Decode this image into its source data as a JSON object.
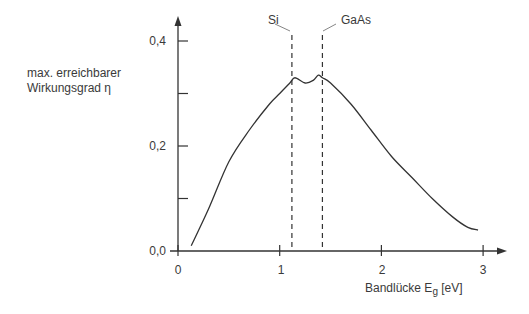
{
  "chart_data": {
    "type": "line",
    "title": "",
    "xlabel": "Bandlücke E_g [eV]",
    "xlabel_main": "Bandlücke E",
    "xlabel_sub": "g",
    "xlabel_unit": " [eV]",
    "ylabel_lines": [
      "max. erreichbarer",
      "Wirkungsgrad η"
    ],
    "ylabel": "max. erreichbarer Wirkungsgrad η",
    "xlim": [
      0,
      3.2
    ],
    "ylim": [
      0,
      0.45
    ],
    "x_ticks": [
      0,
      1,
      2,
      3
    ],
    "x_tick_labels": [
      "0",
      "1",
      "2",
      "3"
    ],
    "y_ticks": [
      0.0,
      0.1,
      0.2,
      0.3,
      0.4
    ],
    "y_tick_labels": [
      "0,0",
      "",
      "0,2",
      "",
      "0,4"
    ],
    "grid": false,
    "series": [
      {
        "name": "max. Wirkungsgrad",
        "x": [
          0.13,
          0.3,
          0.5,
          0.7,
          0.9,
          1.0,
          1.1,
          1.15,
          1.25,
          1.33,
          1.38,
          1.42,
          1.5,
          1.7,
          1.9,
          2.1,
          2.3,
          2.5,
          2.7,
          2.85,
          2.95
        ],
        "y": [
          0.01,
          0.08,
          0.17,
          0.23,
          0.28,
          0.3,
          0.32,
          0.33,
          0.32,
          0.325,
          0.335,
          0.33,
          0.32,
          0.28,
          0.23,
          0.18,
          0.14,
          0.1,
          0.065,
          0.045,
          0.04
        ]
      }
    ],
    "annotations": [
      {
        "text": "Si",
        "x": 1.12,
        "type": "vertical-dashed-line"
      },
      {
        "text": "GaAs",
        "x": 1.42,
        "type": "vertical-dashed-line"
      }
    ]
  }
}
